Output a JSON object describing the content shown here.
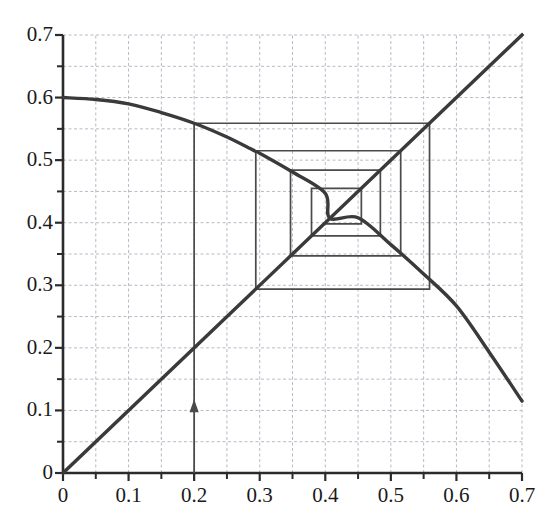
{
  "figure": {
    "title": "",
    "background": "#ffffff",
    "axis_color": "#2b2b2b",
    "grid_color": "#b9b9c6",
    "curve_color": "#3a3a3a",
    "cobweb_color": "#4a4a4a"
  },
  "axes": {
    "x_labels": [
      "0",
      "0.1",
      "0.2",
      "0.3",
      "0.4",
      "0.5",
      "0.6",
      "0.7"
    ],
    "y_labels": [
      "0",
      "0.1",
      "0.2",
      "0.3",
      "0.4",
      "0.5",
      "0.6",
      "0.7"
    ],
    "x_tick_values": [
      0,
      0.1,
      0.2,
      0.3,
      0.4,
      0.5,
      0.6,
      0.7
    ],
    "y_tick_values": [
      0,
      0.1,
      0.2,
      0.3,
      0.4,
      0.5,
      0.6,
      0.7
    ],
    "minor_tick_step": 0.05,
    "xlim": [
      0,
      0.7
    ],
    "ylim": [
      0,
      0.7
    ],
    "xlabel": "",
    "ylabel": ""
  },
  "chart_data": {
    "type": "line",
    "title": "",
    "xlabel": "",
    "ylabel": "",
    "xlim": [
      0,
      0.7
    ],
    "ylim": [
      0,
      0.7
    ],
    "grid": true,
    "grid_step": 0.05,
    "legend": "none",
    "series": [
      {
        "name": "map-curve",
        "kind": "curve",
        "note": "f(x) decreasing concave curve from (0, 0.6) to (0.7, 0.115)",
        "points": [
          [
            0.0,
            0.6
          ],
          [
            0.05,
            0.597
          ],
          [
            0.1,
            0.59
          ],
          [
            0.15,
            0.576
          ],
          [
            0.2,
            0.559
          ],
          [
            0.25,
            0.537
          ],
          [
            0.29,
            0.516
          ],
          [
            0.3,
            0.511
          ],
          [
            0.35,
            0.481
          ],
          [
            0.4,
            0.447
          ],
          [
            0.407,
            0.407
          ],
          [
            0.45,
            0.408
          ],
          [
            0.5,
            0.365
          ],
          [
            0.55,
            0.318
          ],
          [
            0.6,
            0.267
          ],
          [
            0.65,
            0.193
          ],
          [
            0.7,
            0.115
          ]
        ]
      },
      {
        "name": "identity-line",
        "kind": "line",
        "note": "y = x diagonal",
        "points": [
          [
            0.0,
            0.0
          ],
          [
            0.7,
            0.7
          ]
        ]
      },
      {
        "name": "cobweb-path",
        "kind": "staircase",
        "note": "cobweb iteration spiralling inward to fixed point (0.407, 0.407)",
        "start_x": 0.2,
        "fixed_point": [
          0.407,
          0.407
        ],
        "points": [
          [
            0.2,
            0.1
          ],
          [
            0.2,
            0.559
          ],
          [
            0.559,
            0.559
          ],
          [
            0.559,
            0.294
          ],
          [
            0.294,
            0.294
          ],
          [
            0.294,
            0.515
          ],
          [
            0.515,
            0.515
          ],
          [
            0.515,
            0.347
          ],
          [
            0.347,
            0.347
          ],
          [
            0.347,
            0.484
          ],
          [
            0.484,
            0.484
          ],
          [
            0.484,
            0.379
          ],
          [
            0.379,
            0.379
          ],
          [
            0.379,
            0.455
          ],
          [
            0.455,
            0.455
          ],
          [
            0.455,
            0.398
          ],
          [
            0.398,
            0.398
          ]
        ]
      }
    ],
    "annotations": [
      {
        "name": "start-arrow",
        "kind": "arrow",
        "x": 0.2,
        "y_from": 0.0,
        "y_to": 0.118,
        "label": ""
      }
    ]
  }
}
